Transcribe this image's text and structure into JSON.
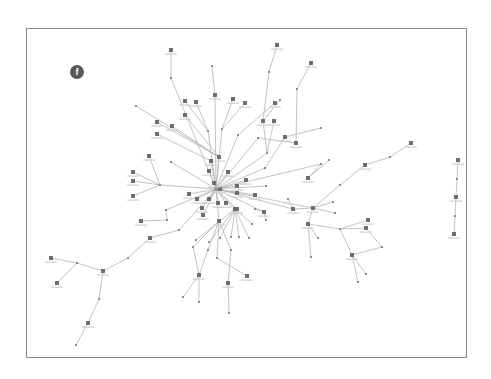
{
  "figure": {
    "panel_label": "f",
    "edge_color": "#b4b4b4",
    "node_color": "#6e6e6e",
    "small_node_color": "#8c8c8c",
    "frame_color": "#8a8a8a",
    "badge_color": "#5a5a5a"
  },
  "graph": {
    "nodes": [
      {
        "id": "n1",
        "x": 171,
        "y": 50,
        "type": "big"
      },
      {
        "id": "n2",
        "x": 171,
        "y": 78,
        "type": "small"
      },
      {
        "id": "n3",
        "x": 212,
        "y": 66,
        "type": "small"
      },
      {
        "id": "n4",
        "x": 215,
        "y": 95,
        "type": "big"
      },
      {
        "id": "n5",
        "x": 277,
        "y": 45,
        "type": "big"
      },
      {
        "id": "n6",
        "x": 269,
        "y": 72,
        "type": "small"
      },
      {
        "id": "n7",
        "x": 311,
        "y": 63,
        "type": "big"
      },
      {
        "id": "n8",
        "x": 297,
        "y": 89,
        "type": "small"
      },
      {
        "id": "n9",
        "x": 185,
        "y": 101,
        "type": "big"
      },
      {
        "id": "n10",
        "x": 196,
        "y": 102,
        "type": "big"
      },
      {
        "id": "n11",
        "x": 185,
        "y": 115,
        "type": "big"
      },
      {
        "id": "n12",
        "x": 233,
        "y": 99,
        "type": "big"
      },
      {
        "id": "n13",
        "x": 245,
        "y": 103,
        "type": "big"
      },
      {
        "id": "n14",
        "x": 275,
        "y": 103,
        "type": "big"
      },
      {
        "id": "n15",
        "x": 280,
        "y": 100,
        "type": "small"
      },
      {
        "id": "n16",
        "x": 136,
        "y": 106,
        "type": "small"
      },
      {
        "id": "n17",
        "x": 157,
        "y": 122,
        "type": "big"
      },
      {
        "id": "n18",
        "x": 172,
        "y": 126,
        "type": "big"
      },
      {
        "id": "n19",
        "x": 157,
        "y": 134,
        "type": "big"
      },
      {
        "id": "n20",
        "x": 208,
        "y": 131,
        "type": "small"
      },
      {
        "id": "n21",
        "x": 222,
        "y": 129,
        "type": "small"
      },
      {
        "id": "n22",
        "x": 263,
        "y": 121,
        "type": "big"
      },
      {
        "id": "n23",
        "x": 274,
        "y": 121,
        "type": "big"
      },
      {
        "id": "n24",
        "x": 238,
        "y": 135,
        "type": "small"
      },
      {
        "id": "n25",
        "x": 258,
        "y": 138,
        "type": "small"
      },
      {
        "id": "n26",
        "x": 285,
        "y": 137,
        "type": "big"
      },
      {
        "id": "n27",
        "x": 296,
        "y": 143,
        "type": "big"
      },
      {
        "id": "n28",
        "x": 321,
        "y": 128,
        "type": "small"
      },
      {
        "id": "n29",
        "x": 149,
        "y": 156,
        "type": "big"
      },
      {
        "id": "n30",
        "x": 171,
        "y": 162,
        "type": "small"
      },
      {
        "id": "n31",
        "x": 219,
        "y": 157,
        "type": "big"
      },
      {
        "id": "n32",
        "x": 211,
        "y": 161,
        "type": "big"
      },
      {
        "id": "n33",
        "x": 267,
        "y": 153,
        "type": "small"
      },
      {
        "id": "n34",
        "x": 265,
        "y": 168,
        "type": "small"
      },
      {
        "id": "n35",
        "x": 133,
        "y": 172,
        "type": "big"
      },
      {
        "id": "n36",
        "x": 133,
        "y": 181,
        "type": "big"
      },
      {
        "id": "n37",
        "x": 133,
        "y": 196,
        "type": "big"
      },
      {
        "id": "n38",
        "x": 160,
        "y": 185,
        "type": "small"
      },
      {
        "id": "n39",
        "x": 189,
        "y": 194,
        "type": "big"
      },
      {
        "id": "n40",
        "x": 220,
        "y": 189,
        "type": "big"
      },
      {
        "id": "n41",
        "x": 237,
        "y": 186,
        "type": "big"
      },
      {
        "id": "n42",
        "x": 246,
        "y": 180,
        "type": "big"
      },
      {
        "id": "n43",
        "x": 222,
        "y": 190,
        "type": "small"
      },
      {
        "id": "n44",
        "x": 214,
        "y": 183,
        "type": "big"
      },
      {
        "id": "n45",
        "x": 237,
        "y": 193,
        "type": "big"
      },
      {
        "id": "n46",
        "x": 255,
        "y": 195,
        "type": "big"
      },
      {
        "id": "n47",
        "x": 266,
        "y": 186,
        "type": "small"
      },
      {
        "id": "n48",
        "x": 228,
        "y": 172,
        "type": "big"
      },
      {
        "id": "n49",
        "x": 209,
        "y": 171,
        "type": "big"
      },
      {
        "id": "n50",
        "x": 197,
        "y": 199,
        "type": "big"
      },
      {
        "id": "n51",
        "x": 209,
        "y": 199,
        "type": "big"
      },
      {
        "id": "n52",
        "x": 218,
        "y": 203,
        "type": "big"
      },
      {
        "id": "n53",
        "x": 226,
        "y": 203,
        "type": "big"
      },
      {
        "id": "n54",
        "x": 235,
        "y": 209,
        "type": "big"
      },
      {
        "id": "n55",
        "x": 237,
        "y": 209,
        "type": "big"
      },
      {
        "id": "n56",
        "x": 202,
        "y": 208,
        "type": "big"
      },
      {
        "id": "n57",
        "x": 166,
        "y": 210,
        "type": "small"
      },
      {
        "id": "n58",
        "x": 167,
        "y": 220,
        "type": "small"
      },
      {
        "id": "n59",
        "x": 141,
        "y": 221,
        "type": "big"
      },
      {
        "id": "n60",
        "x": 179,
        "y": 230,
        "type": "small"
      },
      {
        "id": "n61",
        "x": 203,
        "y": 215,
        "type": "big"
      },
      {
        "id": "n62",
        "x": 219,
        "y": 221,
        "type": "big"
      },
      {
        "id": "n63",
        "x": 150,
        "y": 238,
        "type": "big"
      },
      {
        "id": "n64",
        "x": 196,
        "y": 240,
        "type": "small"
      },
      {
        "id": "n65",
        "x": 209,
        "y": 242,
        "type": "small"
      },
      {
        "id": "n66",
        "x": 220,
        "y": 238,
        "type": "small"
      },
      {
        "id": "n67",
        "x": 231,
        "y": 237,
        "type": "small"
      },
      {
        "id": "n68",
        "x": 239,
        "y": 237,
        "type": "small"
      },
      {
        "id": "n69",
        "x": 249,
        "y": 238,
        "type": "small"
      },
      {
        "id": "n70",
        "x": 252,
        "y": 224,
        "type": "small"
      },
      {
        "id": "n71",
        "x": 255,
        "y": 209,
        "type": "small"
      },
      {
        "id": "n72",
        "x": 264,
        "y": 212,
        "type": "big"
      },
      {
        "id": "n73",
        "x": 266,
        "y": 220,
        "type": "small"
      },
      {
        "id": "n74",
        "x": 193,
        "y": 247,
        "type": "small"
      },
      {
        "id": "n75",
        "x": 208,
        "y": 250,
        "type": "small"
      },
      {
        "id": "n76",
        "x": 217,
        "y": 258,
        "type": "small"
      },
      {
        "id": "n77",
        "x": 231,
        "y": 250,
        "type": "small"
      },
      {
        "id": "n78",
        "x": 128,
        "y": 258,
        "type": "small"
      },
      {
        "id": "n79",
        "x": 51,
        "y": 258,
        "type": "big"
      },
      {
        "id": "n80",
        "x": 77,
        "y": 263,
        "type": "small"
      },
      {
        "id": "n81",
        "x": 57,
        "y": 283,
        "type": "big"
      },
      {
        "id": "n82",
        "x": 103,
        "y": 271,
        "type": "big"
      },
      {
        "id": "n83",
        "x": 199,
        "y": 275,
        "type": "big"
      },
      {
        "id": "n84",
        "x": 247,
        "y": 276,
        "type": "big"
      },
      {
        "id": "n85",
        "x": 228,
        "y": 283,
        "type": "big"
      },
      {
        "id": "n86",
        "x": 183,
        "y": 297,
        "type": "small"
      },
      {
        "id": "n87",
        "x": 199,
        "y": 302,
        "type": "small"
      },
      {
        "id": "n88",
        "x": 99,
        "y": 299,
        "type": "small"
      },
      {
        "id": "n89",
        "x": 88,
        "y": 323,
        "type": "big"
      },
      {
        "id": "n90",
        "x": 76,
        "y": 345,
        "type": "small"
      },
      {
        "id": "n91",
        "x": 229,
        "y": 313,
        "type": "small"
      },
      {
        "id": "n92",
        "x": 321,
        "y": 164,
        "type": "small"
      },
      {
        "id": "n93",
        "x": 308,
        "y": 178,
        "type": "big"
      },
      {
        "id": "n94",
        "x": 329,
        "y": 160,
        "type": "small"
      },
      {
        "id": "n95",
        "x": 365,
        "y": 165,
        "type": "big"
      },
      {
        "id": "n96",
        "x": 390,
        "y": 157,
        "type": "small"
      },
      {
        "id": "n97",
        "x": 411,
        "y": 143,
        "type": "big"
      },
      {
        "id": "n98",
        "x": 340,
        "y": 185,
        "type": "small"
      },
      {
        "id": "n99",
        "x": 288,
        "y": 199,
        "type": "small"
      },
      {
        "id": "n100",
        "x": 293,
        "y": 209,
        "type": "big"
      },
      {
        "id": "n101",
        "x": 313,
        "y": 208,
        "type": "big"
      },
      {
        "id": "n102",
        "x": 333,
        "y": 202,
        "type": "small"
      },
      {
        "id": "n103",
        "x": 335,
        "y": 213,
        "type": "small"
      },
      {
        "id": "n104",
        "x": 308,
        "y": 224,
        "type": "big"
      },
      {
        "id": "n105",
        "x": 318,
        "y": 238,
        "type": "small"
      },
      {
        "id": "n106",
        "x": 340,
        "y": 229,
        "type": "small"
      },
      {
        "id": "n107",
        "x": 368,
        "y": 220,
        "type": "big"
      },
      {
        "id": "n108",
        "x": 366,
        "y": 228,
        "type": "big"
      },
      {
        "id": "n109",
        "x": 382,
        "y": 247,
        "type": "small"
      },
      {
        "id": "n110",
        "x": 352,
        "y": 255,
        "type": "big"
      },
      {
        "id": "n111",
        "x": 311,
        "y": 257,
        "type": "small"
      },
      {
        "id": "n112",
        "x": 366,
        "y": 274,
        "type": "small"
      },
      {
        "id": "n113",
        "x": 358,
        "y": 282,
        "type": "small"
      },
      {
        "id": "n114",
        "x": 458,
        "y": 160,
        "type": "big"
      },
      {
        "id": "n115",
        "x": 457,
        "y": 179,
        "type": "small"
      },
      {
        "id": "n116",
        "x": 456,
        "y": 197,
        "type": "big"
      },
      {
        "id": "n117",
        "x": 455,
        "y": 216,
        "type": "small"
      },
      {
        "id": "n118",
        "x": 454,
        "y": 234,
        "type": "big"
      },
      {
        "id": "n119",
        "x": 216,
        "y": 189,
        "type": "hub"
      }
    ],
    "edges": [
      [
        "n1",
        "n2"
      ],
      [
        "n2",
        "n119"
      ],
      [
        "n3",
        "n4"
      ],
      [
        "n4",
        "n119"
      ],
      [
        "n5",
        "n6"
      ],
      [
        "n6",
        "n22"
      ],
      [
        "n7",
        "n8"
      ],
      [
        "n8",
        "n27"
      ],
      [
        "n9",
        "n20"
      ],
      [
        "n10",
        "n20"
      ],
      [
        "n11",
        "n31"
      ],
      [
        "n12",
        "n21"
      ],
      [
        "n13",
        "n21"
      ],
      [
        "n14",
        "n24"
      ],
      [
        "n15",
        "n22"
      ],
      [
        "n16",
        "n31"
      ],
      [
        "n17",
        "n31"
      ],
      [
        "n18",
        "n31"
      ],
      [
        "n19",
        "n32"
      ],
      [
        "n20",
        "n119"
      ],
      [
        "n21",
        "n119"
      ],
      [
        "n22",
        "n33"
      ],
      [
        "n23",
        "n33"
      ],
      [
        "n24",
        "n119"
      ],
      [
        "n25",
        "n119"
      ],
      [
        "n26",
        "n34"
      ],
      [
        "n27",
        "n25"
      ],
      [
        "n28",
        "n26"
      ],
      [
        "n29",
        "n38"
      ],
      [
        "n30",
        "n119"
      ],
      [
        "n31",
        "n119"
      ],
      [
        "n32",
        "n119"
      ],
      [
        "n33",
        "n119"
      ],
      [
        "n34",
        "n119"
      ],
      [
        "n35",
        "n38"
      ],
      [
        "n36",
        "n38"
      ],
      [
        "n37",
        "n38"
      ],
      [
        "n38",
        "n119"
      ],
      [
        "n39",
        "n119"
      ],
      [
        "n40",
        "n119"
      ],
      [
        "n41",
        "n119"
      ],
      [
        "n42",
        "n119"
      ],
      [
        "n43",
        "n119"
      ],
      [
        "n44",
        "n119"
      ],
      [
        "n45",
        "n119"
      ],
      [
        "n46",
        "n119"
      ],
      [
        "n47",
        "n119"
      ],
      [
        "n48",
        "n119"
      ],
      [
        "n49",
        "n119"
      ],
      [
        "n50",
        "n119"
      ],
      [
        "n51",
        "n119"
      ],
      [
        "n52",
        "n119"
      ],
      [
        "n53",
        "n119"
      ],
      [
        "n54",
        "n119"
      ],
      [
        "n55",
        "n119"
      ],
      [
        "n56",
        "n119"
      ],
      [
        "n57",
        "n119"
      ],
      [
        "n58",
        "n57"
      ],
      [
        "n59",
        "n58"
      ],
      [
        "n60",
        "n119"
      ],
      [
        "n61",
        "n119"
      ],
      [
        "n62",
        "n119"
      ],
      [
        "n63",
        "n60"
      ],
      [
        "n64",
        "n54"
      ],
      [
        "n65",
        "n54"
      ],
      [
        "n66",
        "n54"
      ],
      [
        "n67",
        "n54"
      ],
      [
        "n68",
        "n54"
      ],
      [
        "n69",
        "n54"
      ],
      [
        "n70",
        "n54"
      ],
      [
        "n71",
        "n72"
      ],
      [
        "n72",
        "n119"
      ],
      [
        "n73",
        "n72"
      ],
      [
        "n74",
        "n62"
      ],
      [
        "n75",
        "n62"
      ],
      [
        "n76",
        "n62"
      ],
      [
        "n77",
        "n62"
      ],
      [
        "n78",
        "n63"
      ],
      [
        "n79",
        "n80"
      ],
      [
        "n80",
        "n82"
      ],
      [
        "n81",
        "n80"
      ],
      [
        "n82",
        "n78"
      ],
      [
        "n83",
        "n74"
      ],
      [
        "n83",
        "n75"
      ],
      [
        "n84",
        "n76"
      ],
      [
        "n85",
        "n77"
      ],
      [
        "n86",
        "n83"
      ],
      [
        "n87",
        "n83"
      ],
      [
        "n88",
        "n82"
      ],
      [
        "n89",
        "n88"
      ],
      [
        "n90",
        "n89"
      ],
      [
        "n91",
        "n85"
      ],
      [
        "n92",
        "n119"
      ],
      [
        "n93",
        "n92"
      ],
      [
        "n94",
        "n93"
      ],
      [
        "n95",
        "n98"
      ],
      [
        "n96",
        "n95"
      ],
      [
        "n97",
        "n96"
      ],
      [
        "n98",
        "n101"
      ],
      [
        "n99",
        "n100"
      ],
      [
        "n100",
        "n119"
      ],
      [
        "n101",
        "n100"
      ],
      [
        "n102",
        "n101"
      ],
      [
        "n103",
        "n101"
      ],
      [
        "n104",
        "n101"
      ],
      [
        "n105",
        "n104"
      ],
      [
        "n106",
        "n104"
      ],
      [
        "n107",
        "n106"
      ],
      [
        "n108",
        "n106"
      ],
      [
        "n109",
        "n108"
      ],
      [
        "n110",
        "n109"
      ],
      [
        "n110",
        "n106"
      ],
      [
        "n111",
        "n104"
      ],
      [
        "n112",
        "n110"
      ],
      [
        "n113",
        "n110"
      ],
      [
        "n114",
        "n115"
      ],
      [
        "n115",
        "n116"
      ],
      [
        "n116",
        "n117"
      ],
      [
        "n117",
        "n118"
      ],
      [
        "n119",
        "n101"
      ]
    ]
  }
}
